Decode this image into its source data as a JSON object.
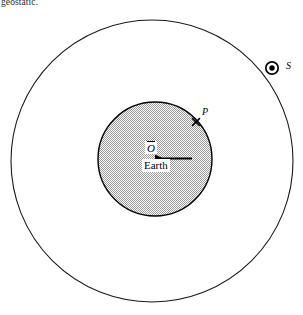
{
  "figure": {
    "name": "geostationary-satellite-orbit-diagram",
    "caption_fragment": "geostatic.",
    "background_color": "#ffffff",
    "stroke_color": "#000000",
    "earth_fill_color": "#b4b4b4"
  },
  "labels": {
    "satellite": "S",
    "point_on_earth": "P",
    "center": "O",
    "earth": "Earth"
  },
  "geometry": {
    "orbit": {
      "center_x": 152,
      "center_y": 161,
      "radius": 141,
      "stroke_width": 1.1
    },
    "earth": {
      "center_x": 155,
      "center_y": 159,
      "radius": 57,
      "stroke_width": 1.4
    },
    "satellite": {
      "x": 272,
      "y": 68,
      "outer_radius": 6.2,
      "ring_width": 1.6,
      "dot_radius": 2.6
    },
    "point_p": {
      "x": 196,
      "y": 122,
      "marker": "cross",
      "marker_size": 4.2
    },
    "radius_arrow": {
      "x1": 155,
      "y1": 158,
      "x2": 192,
      "y2": 158
    }
  },
  "icons": {
    "satellite_marker": "satellite-dot-icon",
    "point_marker": "cross-marker-icon",
    "radius_marker": "radius-arrow-icon"
  }
}
